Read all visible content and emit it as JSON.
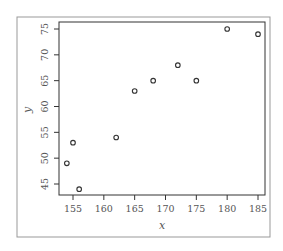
{
  "chart_data": {
    "type": "scatter",
    "title": "",
    "xlabel": "x",
    "ylabel": "y",
    "xlim": [
      153,
      186
    ],
    "ylim": [
      42.5,
      76.5
    ],
    "xticks": [
      155,
      160,
      165,
      170,
      175,
      180,
      185
    ],
    "yticks": [
      45,
      50,
      55,
      60,
      65,
      70,
      75
    ],
    "xtick_labels": [
      "155",
      "160",
      "165",
      "170",
      "175",
      "180",
      "185"
    ],
    "ytick_labels": [
      "45",
      "50",
      "55",
      "60",
      "65",
      "70",
      "75"
    ],
    "grid": false,
    "legend": null,
    "marker": "open-circle",
    "points": [
      {
        "x": 154,
        "y": 49
      },
      {
        "x": 155,
        "y": 53
      },
      {
        "x": 156,
        "y": 44
      },
      {
        "x": 162,
        "y": 54
      },
      {
        "x": 165,
        "y": 63
      },
      {
        "x": 168,
        "y": 65
      },
      {
        "x": 172,
        "y": 68
      },
      {
        "x": 175,
        "y": 65
      },
      {
        "x": 180,
        "y": 75
      },
      {
        "x": 185,
        "y": 74
      }
    ]
  },
  "colors": {
    "axis": "#333333",
    "frame": "#888888",
    "text": "#555555",
    "marker": "#333333"
  }
}
